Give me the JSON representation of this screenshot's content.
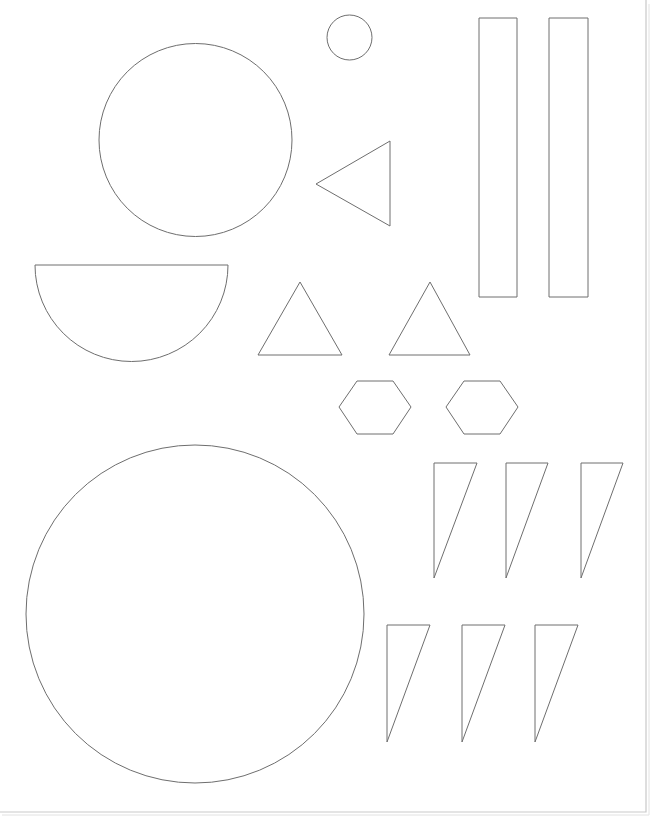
{
  "document": {
    "title": "Shapes Cutout Template",
    "background_color": "#ffffff",
    "stroke_color": "#6e6e6e",
    "fill_color": "#ffffff",
    "page_edge_color": "#c9c9c9",
    "width": 663,
    "height": 827
  },
  "page_border": {
    "name": "page-edge",
    "right_x": 646,
    "bottom_y": 812,
    "visible_edges": "right, bottom"
  },
  "shapes": [
    {
      "id": "circle-large-top",
      "type": "circle",
      "label": "Large circle",
      "cx": 195.5,
      "cy": 140,
      "r": 96.5
    },
    {
      "id": "circle-small",
      "type": "circle",
      "label": "Small circle",
      "cx": 349.5,
      "cy": 37.5,
      "r": 22.5
    },
    {
      "id": "semicircle",
      "type": "semicircle",
      "label": "Half circle",
      "cx": 131.5,
      "cy": 265,
      "r": 96.5,
      "orientation": "flat-top"
    },
    {
      "id": "triangle-left-pointing",
      "type": "triangle",
      "label": "Left-pointing triangle",
      "points": "390,141 390,226 316,184"
    },
    {
      "id": "triangle-up-1",
      "type": "triangle",
      "label": "Upward triangle 1",
      "points": "300,282 342,355 258,355"
    },
    {
      "id": "triangle-up-2",
      "type": "triangle",
      "label": "Upward triangle 2",
      "points": "430,282 470,355 389,355"
    },
    {
      "id": "rectangle-tall-1",
      "type": "rectangle",
      "label": "Tall rectangle 1",
      "x": 479,
      "y": 18,
      "width": 38,
      "height": 279
    },
    {
      "id": "rectangle-tall-2",
      "type": "rectangle",
      "label": "Tall rectangle 2",
      "x": 549,
      "y": 18,
      "width": 39,
      "height": 279
    },
    {
      "id": "hexagon-1",
      "type": "hexagon",
      "label": "Hexagon 1",
      "points": "357,381 393,381 411,407 393,434 357,434 339,407"
    },
    {
      "id": "hexagon-2",
      "type": "hexagon",
      "label": "Hexagon 2",
      "points": "464,381 500,381 518,407 500,434 464,434 446,407"
    },
    {
      "id": "sliver-triangle-row1-1",
      "type": "right-triangle",
      "label": "Narrow triangle row 1 item 1",
      "points": "434,463 477,463 434,578"
    },
    {
      "id": "sliver-triangle-row1-2",
      "type": "right-triangle",
      "label": "Narrow triangle row 1 item 2",
      "points": "506,463 548,463 506,578"
    },
    {
      "id": "sliver-triangle-row1-3",
      "type": "right-triangle",
      "label": "Narrow triangle row 1 item 3",
      "points": "581,463 623,463 581,578"
    },
    {
      "id": "sliver-triangle-row2-1",
      "type": "right-triangle",
      "label": "Narrow triangle row 2 item 1",
      "points": "387,625 430,625 387,742"
    },
    {
      "id": "sliver-triangle-row2-2",
      "type": "right-triangle",
      "label": "Narrow triangle row 2 item 2",
      "points": "462,625 505,625 462,742"
    },
    {
      "id": "sliver-triangle-row2-3",
      "type": "right-triangle",
      "label": "Narrow triangle row 2 item 3",
      "points": "535,625 578,625 535,742"
    },
    {
      "id": "circle-large-bottom",
      "type": "circle",
      "label": "Extra large circle",
      "cx": 195,
      "cy": 614,
      "r": 169
    }
  ],
  "summary": {
    "shape_count": 17,
    "circles": 3,
    "triangles": 9,
    "rectangles": 2,
    "hexagons": 2,
    "semicircles": 1
  }
}
